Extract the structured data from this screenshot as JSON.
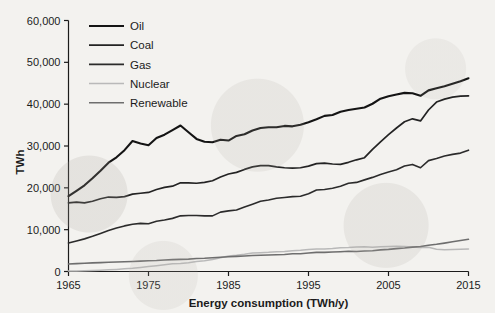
{
  "chart_data": {
    "type": "line",
    "title": "",
    "xlabel": "Energy consumption (TWh/y)",
    "ylabel": "TWh",
    "xlim": [
      1965,
      2015
    ],
    "ylim": [
      0,
      60000
    ],
    "xticks": [
      1965,
      1975,
      1985,
      1995,
      2005,
      2015
    ],
    "xtick_labels": [
      "1965",
      "1975",
      "1985",
      "1995",
      "2005",
      "2015"
    ],
    "yticks": [
      0,
      10000,
      20000,
      30000,
      40000,
      50000,
      60000
    ],
    "ytick_labels": [
      "0",
      "10,000",
      "20,000",
      "30,000",
      "40,000",
      "50,000",
      "60,000"
    ],
    "grid": false,
    "legend_position": "upper left inside",
    "x": [
      1965,
      1966,
      1967,
      1968,
      1969,
      1970,
      1971,
      1972,
      1973,
      1974,
      1975,
      1976,
      1977,
      1978,
      1979,
      1980,
      1981,
      1982,
      1983,
      1984,
      1985,
      1986,
      1987,
      1988,
      1989,
      1990,
      1991,
      1992,
      1993,
      1994,
      1995,
      1996,
      1997,
      1998,
      1999,
      2000,
      2001,
      2002,
      2003,
      2004,
      2005,
      2006,
      2007,
      2008,
      2009,
      2010,
      2011,
      2012,
      2013,
      2014,
      2015
    ],
    "series": [
      {
        "name": "Oil",
        "color": "#141414",
        "width": 2.1,
        "values": [
          18000,
          19300,
          20600,
          22300,
          24100,
          26000,
          27300,
          29000,
          31200,
          30600,
          30200,
          31900,
          32700,
          33800,
          34900,
          33300,
          31700,
          31000,
          30900,
          31500,
          31300,
          32400,
          32800,
          33700,
          34300,
          34500,
          34500,
          34800,
          34700,
          35100,
          35700,
          36400,
          37200,
          37400,
          38200,
          38600,
          38900,
          39200,
          40100,
          41300,
          41900,
          42300,
          42700,
          42600,
          42000,
          43300,
          43800,
          44300,
          44900,
          45500,
          46200
        ]
      },
      {
        "name": "Coal",
        "color": "#232323",
        "width": 1.7,
        "values": [
          16400,
          16600,
          16400,
          16800,
          17400,
          17800,
          17700,
          17900,
          18500,
          18700,
          18900,
          19600,
          20100,
          20400,
          21200,
          21200,
          21100,
          21300,
          21700,
          22600,
          23300,
          23700,
          24400,
          25000,
          25300,
          25300,
          25000,
          24800,
          24700,
          24800,
          25200,
          25800,
          25900,
          25700,
          25600,
          26100,
          26700,
          27200,
          29200,
          31000,
          32700,
          34300,
          35800,
          36500,
          36000,
          38600,
          40500,
          41200,
          41700,
          41900,
          42000
        ]
      },
      {
        "name": "Gas",
        "color": "#2b2b2b",
        "width": 1.6,
        "values": [
          6800,
          7300,
          7800,
          8400,
          9100,
          9800,
          10400,
          10900,
          11300,
          11500,
          11400,
          12000,
          12300,
          12700,
          13300,
          13400,
          13400,
          13300,
          13300,
          14200,
          14500,
          14700,
          15400,
          16100,
          16800,
          17100,
          17500,
          17700,
          17900,
          18000,
          18600,
          19500,
          19600,
          19900,
          20400,
          21100,
          21300,
          21900,
          22500,
          23200,
          23800,
          24300,
          25200,
          25600,
          24800,
          26500,
          27000,
          27600,
          28000,
          28300,
          29000
        ]
      },
      {
        "name": "Nuclear",
        "color": "#b9b9b9",
        "width": 1.5,
        "values": [
          110,
          140,
          180,
          230,
          300,
          390,
          500,
          640,
          790,
          980,
          1200,
          1390,
          1610,
          1860,
          1940,
          2080,
          2400,
          2560,
          2870,
          3310,
          3700,
          3880,
          4110,
          4400,
          4470,
          4580,
          4750,
          4800,
          4950,
          5050,
          5250,
          5400,
          5380,
          5480,
          5700,
          5720,
          5840,
          5890,
          5770,
          5940,
          6000,
          6010,
          5970,
          5860,
          5720,
          5780,
          5330,
          5200,
          5230,
          5300,
          5350
        ]
      },
      {
        "name": "Renewable",
        "color": "#6e6e6e",
        "width": 1.6,
        "values": [
          1800,
          1880,
          1960,
          2050,
          2120,
          2200,
          2260,
          2330,
          2380,
          2470,
          2570,
          2620,
          2740,
          2850,
          2900,
          2970,
          3090,
          3150,
          3300,
          3420,
          3530,
          3620,
          3720,
          3830,
          3880,
          3960,
          4020,
          4060,
          4230,
          4250,
          4430,
          4560,
          4580,
          4650,
          4720,
          4830,
          4780,
          4890,
          4960,
          5160,
          5280,
          5460,
          5620,
          5830,
          5960,
          6280,
          6510,
          6790,
          7100,
          7400,
          7700
        ]
      }
    ]
  },
  "axis": {
    "y_title": "TWh",
    "x_title": "Energy consumption (TWh/y)"
  },
  "legend": {
    "items": [
      {
        "label": "Oil"
      },
      {
        "label": "Coal"
      },
      {
        "label": "Gas"
      },
      {
        "label": "Nuclear"
      },
      {
        "label": "Renewable"
      }
    ]
  }
}
